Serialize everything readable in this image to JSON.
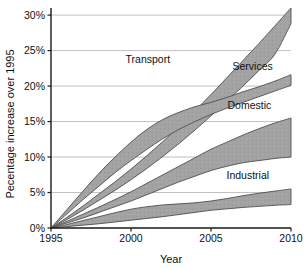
{
  "chart_data": {
    "type": "area",
    "title": "",
    "xlabel": "Year",
    "ylabel": "Pecentage increase over 1995",
    "xlim": [
      1995,
      2010
    ],
    "ylim": [
      0,
      31
    ],
    "grid": true,
    "legend_position": "inline-labels",
    "x_ticks": [
      "1995",
      "2000",
      "2005",
      "2010"
    ],
    "x_tick_values": [
      1995,
      2000,
      2005,
      2010
    ],
    "y_ticks": [
      "0%",
      "5%",
      "10%",
      "15%",
      "20%",
      "25%",
      "30%"
    ],
    "y_tick_values": [
      0,
      5,
      10,
      15,
      20,
      25,
      30
    ],
    "band_fill": "#a0a0a0",
    "band_stroke": "#4f4f4f",
    "gridline_color": "#b9b9b9",
    "axis_color": "#1a1a1a",
    "series": [
      {
        "name": "Transport",
        "label": "Transport",
        "label_x": 2001.05,
        "label_y": 23.2,
        "x": [
          1995,
          1996,
          1997,
          1998,
          1999,
          2000,
          2001,
          2002,
          2003,
          2004,
          2005,
          2006,
          2007,
          2008,
          2009,
          2010
        ],
        "upper": [
          0,
          1.5,
          3.1,
          4.8,
          6.5,
          8.3,
          10.2,
          12.2,
          14.3,
          16.5,
          18.8,
          21.2,
          23.6,
          26.0,
          28.5,
          31.0
        ],
        "lower": [
          0,
          1.2,
          2.5,
          3.9,
          5.3,
          6.8,
          8.4,
          10.1,
          11.9,
          13.8,
          15.8,
          17.9,
          20.0,
          22.2,
          24.5,
          28.8
        ]
      },
      {
        "name": "Services",
        "label": "Services",
        "label_x": 2007.6,
        "label_y": 22.2,
        "x": [
          1995,
          1996,
          1997,
          1998,
          1999,
          2000,
          2001,
          2002,
          2003,
          2004,
          2005,
          2006,
          2007,
          2008,
          2009,
          2010
        ],
        "upper": [
          0,
          2.6,
          5.2,
          7.7,
          10.0,
          12.1,
          13.9,
          15.3,
          16.3,
          17.1,
          17.7,
          18.4,
          19.2,
          19.9,
          20.7,
          21.6
        ],
        "lower": [
          0,
          2.0,
          4.0,
          5.9,
          7.8,
          9.5,
          11.1,
          12.6,
          13.9,
          15.0,
          16.0,
          16.9,
          17.7,
          18.5,
          19.3,
          20.1
        ]
      },
      {
        "name": "Domestic",
        "label": "Domestic",
        "label_x": 2007.4,
        "label_y": 16.8,
        "x": [
          1995,
          1996,
          1997,
          1998,
          1999,
          2000,
          2001,
          2002,
          2003,
          2004,
          2005,
          2006,
          2007,
          2008,
          2009,
          2010
        ],
        "upper": [
          0,
          0.95,
          1.95,
          2.95,
          4.0,
          5.1,
          6.3,
          7.5,
          8.7,
          9.9,
          11.1,
          12.1,
          13.1,
          14.0,
          14.8,
          15.5
        ],
        "lower": [
          0,
          0.7,
          1.4,
          2.2,
          3.0,
          3.8,
          4.7,
          5.6,
          6.5,
          7.3,
          8.1,
          8.7,
          9.2,
          9.5,
          9.8,
          10.0
        ]
      },
      {
        "name": "Industrial",
        "label": "Industrial",
        "label_x": 2007.3,
        "label_y": 6.9,
        "x": [
          1995,
          1996,
          1997,
          1998,
          1999,
          2000,
          2001,
          2002,
          2003,
          2004,
          2005,
          2006,
          2007,
          2008,
          2009,
          2010
        ],
        "upper": [
          0,
          0.5,
          1.05,
          1.6,
          2.15,
          2.65,
          3.0,
          3.25,
          3.4,
          3.55,
          3.8,
          4.15,
          4.55,
          4.9,
          5.2,
          5.5
        ],
        "lower": [
          0,
          0.2,
          0.4,
          0.6,
          0.85,
          1.1,
          1.35,
          1.6,
          1.9,
          2.2,
          2.5,
          2.7,
          2.9,
          3.05,
          3.2,
          3.3
        ]
      }
    ]
  }
}
